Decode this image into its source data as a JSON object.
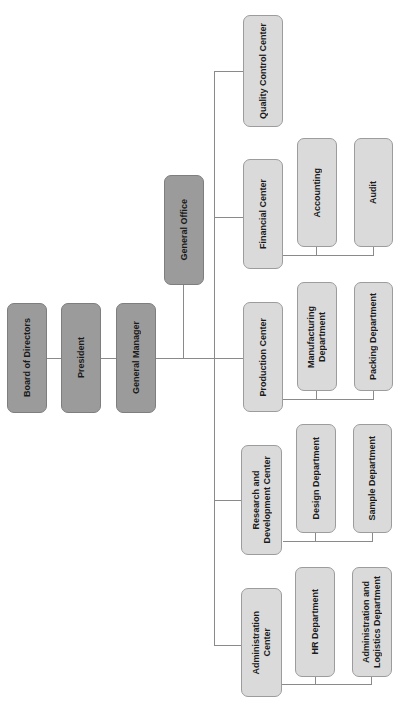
{
  "diagram": {
    "type": "org-chart",
    "orientation": "rotated-90-ccw",
    "colors": {
      "executive_fill": "#9b9b9b",
      "executive_border": "#7e7e7e",
      "department_fill": "#dadada",
      "department_border": "#9c9c9c",
      "connector": "#8a8a8a"
    },
    "executive": [
      {
        "id": "board",
        "label": "Board of Directors"
      },
      {
        "id": "president",
        "label": "President"
      },
      {
        "id": "general_manager",
        "label": "General Manager"
      },
      {
        "id": "general_office",
        "label": "General Office"
      }
    ],
    "centers": [
      {
        "id": "quality",
        "label": "Quality Control Center",
        "departments": []
      },
      {
        "id": "financial",
        "label": "Financial Center",
        "departments": [
          {
            "label": "Accounting"
          },
          {
            "label": "Audit"
          }
        ]
      },
      {
        "id": "production",
        "label": "Production Center",
        "departments": [
          {
            "label": "Manufacturing\nDepartment"
          },
          {
            "label": "Packing Department"
          }
        ]
      },
      {
        "id": "rnd",
        "label": "Research and\nDevelopment Center",
        "departments": [
          {
            "label": "Design Department"
          },
          {
            "label": "Sample Department"
          }
        ]
      },
      {
        "id": "admin",
        "label": "Administration\nCenter",
        "departments": [
          {
            "label": "HR Department"
          },
          {
            "label": "Administration and\nLogistics Department"
          }
        ]
      }
    ]
  }
}
